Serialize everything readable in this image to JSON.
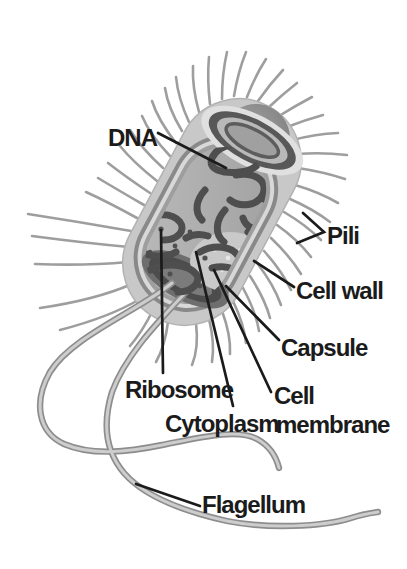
{
  "figure": {
    "type": "labeled-diagram",
    "labels": {
      "dna": "DNA",
      "pili": "Pili",
      "cell_wall": "Cell wall",
      "capsule": "Capsule",
      "cell_membrane_line1": "Cell",
      "cell_membrane_line2": "membrane",
      "ribosome": "Ribosome",
      "cytoplasm": "Cytoplasm",
      "flagellum": "Flagellum"
    },
    "colors": {
      "background": "#ffffff",
      "label_text": "#1b1b1b",
      "leader_line": "#1b1b1b",
      "capsule_outer": "#c8c8c8",
      "cell_wall_ring": "#898989",
      "inner_light_ring": "#d8d8d8",
      "membrane_ring": "#9e9e9e",
      "cytoplasm_fill": "#aeaeae",
      "lid_dark_ring": "#585858",
      "opening_dark": "#4c4c4c",
      "dna_strand": "#4e4e4e",
      "pili_stroke": "#9e9e9e",
      "flagella_stroke": "#8d8d8d",
      "flagella_core": "#cdcdcd"
    }
  }
}
